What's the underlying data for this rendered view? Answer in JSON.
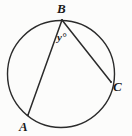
{
  "figure": {
    "type": "geometry-diagram",
    "background_color": "#fcfcfb",
    "stroke_color": "#2b2b2b",
    "label_color": "#1a1a1a"
  },
  "circle": {
    "name": "circle",
    "center_x": 61,
    "center_y": 74,
    "radius": 54,
    "stroke_width": 1.4
  },
  "points": [
    {
      "id": "B",
      "label": "B",
      "x": 62,
      "y": 20
    },
    {
      "id": "A",
      "label": "A",
      "x": 28,
      "y": 115
    },
    {
      "id": "C",
      "label": "C",
      "x": 111,
      "y": 82
    }
  ],
  "chords": [
    {
      "id": "BA",
      "from": "B",
      "to": "A",
      "x1": 62,
      "y1": 20,
      "x2": 28,
      "y2": 115
    },
    {
      "id": "BC",
      "from": "B",
      "to": "C",
      "x1": 62,
      "y1": 20,
      "x2": 111,
      "y2": 82
    }
  ],
  "angles": [
    {
      "id": "y",
      "label": "y°",
      "vertex": "B",
      "rays": [
        "BA",
        "BC"
      ]
    }
  ],
  "labels": {
    "point_b": "B",
    "point_a": "A",
    "point_c": "C",
    "angle_y": "y°"
  }
}
